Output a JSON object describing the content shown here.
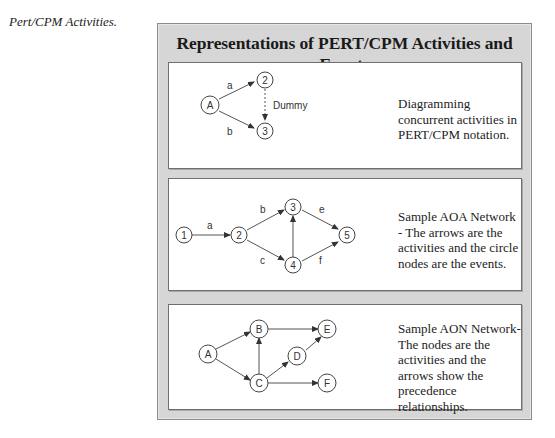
{
  "caption": "Pert/CPM Activities.",
  "figure": {
    "title": "Representations of PERT/CPM Activities and Events",
    "panels": [
      {
        "id": "concurrent",
        "description": "Diagramming concurrent activities in PERT/CPM notation.",
        "nodes": [
          "A",
          "2",
          "3"
        ],
        "edges": [
          {
            "from": "A",
            "to": "2",
            "label": "a"
          },
          {
            "from": "A",
            "to": "3",
            "label": "b"
          },
          {
            "from": "2",
            "to": "3",
            "label": "Dummy",
            "style": "dashed"
          }
        ]
      },
      {
        "id": "aoa",
        "description": "Sample AOA Network - The arrows are the activities and the circle nodes are the events.",
        "nodes": [
          "1",
          "2",
          "3",
          "4",
          "5"
        ],
        "edges": [
          {
            "from": "1",
            "to": "2",
            "label": "a"
          },
          {
            "from": "2",
            "to": "3",
            "label": "b"
          },
          {
            "from": "2",
            "to": "4",
            "label": "c"
          },
          {
            "from": "4",
            "to": "3",
            "label": ""
          },
          {
            "from": "3",
            "to": "5",
            "label": "e"
          },
          {
            "from": "4",
            "to": "5",
            "label": "f"
          }
        ]
      },
      {
        "id": "aon",
        "description": "Sample AON Network- The nodes are the activities and the arrows show the precedence relationships.",
        "nodes": [
          "A",
          "B",
          "C",
          "D",
          "E",
          "F"
        ],
        "edges": [
          {
            "from": "A",
            "to": "B"
          },
          {
            "from": "A",
            "to": "C"
          },
          {
            "from": "C",
            "to": "B"
          },
          {
            "from": "B",
            "to": "E"
          },
          {
            "from": "C",
            "to": "D"
          },
          {
            "from": "D",
            "to": "E"
          },
          {
            "from": "C",
            "to": "F"
          }
        ]
      }
    ]
  },
  "labels": {
    "p1": {
      "A": "A",
      "n2": "2",
      "n3": "3",
      "a": "a",
      "b": "b",
      "dummy": "Dummy"
    },
    "p2": {
      "n1": "1",
      "n2": "2",
      "n3": "3",
      "n4": "4",
      "n5": "5",
      "a": "a",
      "b": "b",
      "c": "c",
      "e": "e",
      "f": "f"
    },
    "p3": {
      "A": "A",
      "B": "B",
      "C": "C",
      "D": "D",
      "E": "E",
      "F": "F"
    }
  },
  "colors": {
    "frame_bg": "#d6d6d6",
    "panel_bg": "#ffffff",
    "stroke": "#444444"
  }
}
